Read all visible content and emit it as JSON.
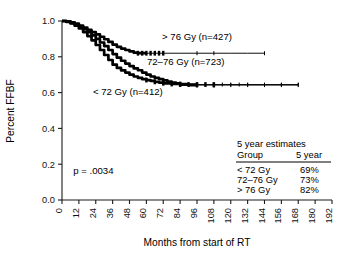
{
  "chart_data": {
    "type": "line",
    "title": "",
    "xlabel": "Months from start of RT",
    "ylabel": "Percent FFBF",
    "xlim": [
      0,
      192
    ],
    "ylim": [
      0.0,
      1.0
    ],
    "xticks": [
      0,
      12,
      24,
      36,
      48,
      60,
      72,
      84,
      96,
      108,
      120,
      132,
      144,
      156,
      168,
      180,
      192
    ],
    "yticks": [
      "0.0",
      "0.2",
      "0.4",
      "0.6",
      "0.8",
      "1.0"
    ],
    "grid": false,
    "legend_position": "inline-annotations",
    "annotations": [
      {
        "name": "p-value",
        "text": "p = .0034",
        "x": 8,
        "y": 0.145
      },
      {
        "name": "curve-label-high",
        "text": "> 76 Gy (n=427)",
        "x": 96,
        "y": 0.895
      },
      {
        "name": "curve-label-mid",
        "text": "72–76 Gy (n=723)",
        "x": 88,
        "y": 0.755
      },
      {
        "name": "curve-label-low",
        "text": "< 72 Gy (n=412)",
        "x": 22,
        "y": 0.585
      }
    ],
    "series": [
      {
        "name": "> 76 Gy (n=427)",
        "label": "> 76 Gy (n=427)",
        "n": 427,
        "five_year_estimate": "82%",
        "points": [
          [
            0,
            1.0
          ],
          [
            3,
            0.998
          ],
          [
            6,
            0.993
          ],
          [
            9,
            0.986
          ],
          [
            12,
            0.975
          ],
          [
            15,
            0.963
          ],
          [
            18,
            0.95
          ],
          [
            21,
            0.938
          ],
          [
            24,
            0.925
          ],
          [
            27,
            0.912
          ],
          [
            30,
            0.898
          ],
          [
            33,
            0.883
          ],
          [
            36,
            0.868
          ],
          [
            39,
            0.856
          ],
          [
            42,
            0.846
          ],
          [
            45,
            0.838
          ],
          [
            48,
            0.83
          ],
          [
            51,
            0.823
          ],
          [
            54,
            0.82
          ],
          [
            60,
            0.82
          ],
          [
            72,
            0.82
          ],
          [
            84,
            0.82
          ],
          [
            96,
            0.82
          ],
          [
            108,
            0.82
          ],
          [
            120,
            0.82
          ],
          [
            132,
            0.82
          ],
          [
            144,
            0.82
          ]
        ],
        "censor_times": [
          54,
          57,
          60,
          63,
          66,
          69,
          72,
          96,
          108,
          144
        ]
      },
      {
        "name": "72–76 Gy (n=723)",
        "label": "72–76 Gy (n=723)",
        "n": 723,
        "five_year_estimate": "73%",
        "points": [
          [
            0,
            1.0
          ],
          [
            3,
            0.996
          ],
          [
            6,
            0.99
          ],
          [
            9,
            0.981
          ],
          [
            12,
            0.969
          ],
          [
            15,
            0.955
          ],
          [
            18,
            0.938
          ],
          [
            21,
            0.92
          ],
          [
            24,
            0.9
          ],
          [
            27,
            0.88
          ],
          [
            30,
            0.86
          ],
          [
            33,
            0.838
          ],
          [
            36,
            0.815
          ],
          [
            39,
            0.795
          ],
          [
            42,
            0.778
          ],
          [
            45,
            0.762
          ],
          [
            48,
            0.748
          ],
          [
            51,
            0.735
          ],
          [
            54,
            0.725
          ],
          [
            57,
            0.712
          ],
          [
            60,
            0.7
          ],
          [
            63,
            0.69
          ],
          [
            66,
            0.682
          ],
          [
            69,
            0.675
          ],
          [
            72,
            0.668
          ],
          [
            75,
            0.662
          ],
          [
            78,
            0.656
          ],
          [
            81,
            0.652
          ],
          [
            84,
            0.648
          ],
          [
            90,
            0.645
          ],
          [
            96,
            0.645
          ],
          [
            108,
            0.645
          ],
          [
            120,
            0.645
          ],
          [
            132,
            0.645
          ],
          [
            144,
            0.645
          ],
          [
            156,
            0.645
          ],
          [
            168,
            0.645
          ]
        ],
        "censor_times": [
          84,
          90,
          96,
          102,
          108,
          114,
          120,
          126,
          132,
          144,
          156,
          168
        ]
      },
      {
        "name": "< 72 Gy (n=412)",
        "label": "< 72 Gy (n=412)",
        "n": 412,
        "five_year_estimate": "69%",
        "points": [
          [
            0,
            1.0
          ],
          [
            3,
            0.995
          ],
          [
            6,
            0.986
          ],
          [
            9,
            0.974
          ],
          [
            12,
            0.958
          ],
          [
            15,
            0.938
          ],
          [
            18,
            0.916
          ],
          [
            21,
            0.892
          ],
          [
            24,
            0.866
          ],
          [
            27,
            0.838
          ],
          [
            30,
            0.81
          ],
          [
            33,
            0.782
          ],
          [
            36,
            0.756
          ],
          [
            39,
            0.738
          ],
          [
            42,
            0.724
          ],
          [
            45,
            0.712
          ],
          [
            48,
            0.7
          ],
          [
            51,
            0.69
          ],
          [
            54,
            0.682
          ],
          [
            57,
            0.675
          ],
          [
            60,
            0.67
          ],
          [
            63,
            0.665
          ],
          [
            66,
            0.66
          ],
          [
            69,
            0.656
          ],
          [
            72,
            0.652
          ],
          [
            78,
            0.648
          ],
          [
            84,
            0.645
          ],
          [
            90,
            0.642
          ],
          [
            96,
            0.642
          ],
          [
            108,
            0.642
          ],
          [
            120,
            0.642
          ],
          [
            132,
            0.642
          ],
          [
            144,
            0.642
          ],
          [
            156,
            0.642
          ],
          [
            168,
            0.642
          ]
        ],
        "censor_times": [
          60,
          66,
          72,
          78,
          84,
          96,
          108,
          120,
          132,
          144,
          156,
          168
        ]
      }
    ]
  },
  "legend_table": {
    "title": "5 year estimates",
    "columns": [
      "Group",
      "5 year"
    ],
    "rows": [
      {
        "group": "< 72 Gy",
        "five_year": "69%"
      },
      {
        "group": "72–76 Gy",
        "five_year": "73%"
      },
      {
        "group": "> 76 Gy",
        "five_year": "82%"
      }
    ]
  },
  "statistics": {
    "p_value_label": "p = .0034"
  }
}
